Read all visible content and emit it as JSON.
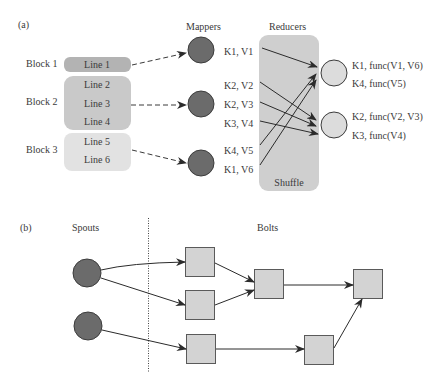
{
  "panel_a": {
    "label": "(a)",
    "headers": {
      "mappers": "Mappers",
      "reducers": "Reducers"
    },
    "blocks": [
      {
        "label": "Block 1",
        "lines": [
          "Line 1"
        ],
        "fill": "#b3b3b3"
      },
      {
        "label": "Block 2",
        "lines": [
          "Line 2",
          "Line 3",
          "Line 4"
        ],
        "fill": "#c9c9c9"
      },
      {
        "label": "Block 3",
        "lines": [
          "Line 5",
          "Line 6"
        ],
        "fill": "#e2e2e2"
      }
    ],
    "mapper_outputs": [
      "K1, V1",
      "K2, V2",
      "K2, V3",
      "K3, V4",
      "K4, V5",
      "K1, V6"
    ],
    "shuffle_label": "Shuffle",
    "reducer_outputs": [
      [
        "K1, func(V1, V6)",
        "K4, func(V5)"
      ],
      [
        "K2, func(V2, V3)",
        "K3, func(V4)"
      ]
    ],
    "colors": {
      "mapper": "#6b6b6b",
      "reducer": "#dcdcdc",
      "shuffle_box": "#cfcfcf"
    }
  },
  "panel_b": {
    "label": "(b)",
    "headers": {
      "spouts": "Spouts",
      "bolts": "Bolts"
    },
    "spout_count": 2,
    "bolt_count": 6,
    "colors": {
      "spout": "#6b6b6b",
      "bolt": "#d3d3d3"
    }
  }
}
